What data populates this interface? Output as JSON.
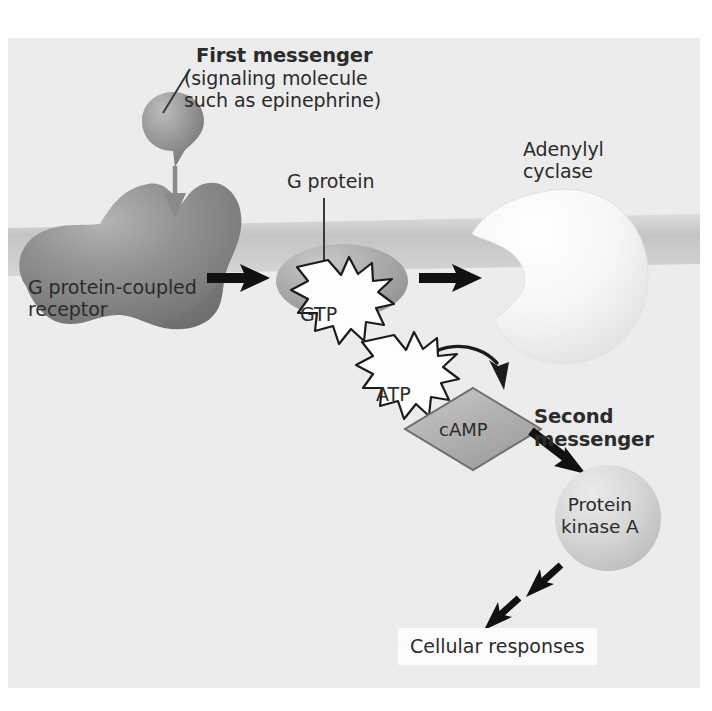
{
  "figure": {
    "background_color": "#ececec",
    "page_color": "#ffffff",
    "text_color": "#2b2b2b"
  },
  "labels": {
    "first_messenger_bold": "First messenger",
    "first_messenger_sub": "(signaling molecule\nsuch as epinephrine)",
    "gpcr": "G protein-coupled\nreceptor",
    "g_protein": "G protein",
    "adenylyl_cyclase": "Adenylyl\ncyclase",
    "second_messenger": "Second\nmessenger",
    "protein_kinase_a": "Protein\nkinase A",
    "cellular_responses": "Cellular responses"
  },
  "molecules": {
    "gtp": "GTP",
    "atp": "ATP",
    "camp": "cAMP"
  },
  "colors": {
    "membrane": "#c8c8c8",
    "receptor": "#8d8d8d",
    "g_protein": "#a9a9a9",
    "adenylyl_cyclase": "#f4f4f4",
    "camp_diamond": "#b4b4b4",
    "protein_kinase": "#d2d2d2",
    "first_messenger": "#949494",
    "burst_fill": "#fdfdfd",
    "arrow_black": "#111111",
    "arrow_gray": "#8a8a8a",
    "leader_line": "#3a3a3a"
  },
  "pathway_steps": [
    "First messenger (signaling molecule such as epinephrine) binds G protein-coupled receptor",
    "Receptor activates G protein bound to GTP",
    "G protein activates adenylyl cyclase",
    "Adenylyl cyclase converts ATP to cAMP",
    "cAMP (second messenger) activates Protein kinase A",
    "Protein kinase A triggers cellular responses"
  ]
}
